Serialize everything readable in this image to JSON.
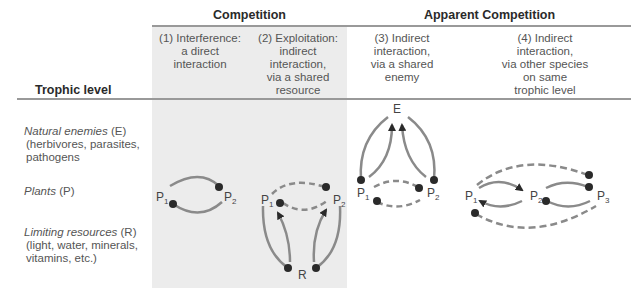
{
  "header": {
    "group_competition": "Competition",
    "group_apparent": "Apparent Competition",
    "row_header": "Trophic level"
  },
  "columns": [
    {
      "id": 1,
      "lines": [
        "(1) Interference:",
        "a direct",
        "interaction"
      ]
    },
    {
      "id": 2,
      "lines": [
        "(2) Exploitation:",
        "indirect",
        "interaction,",
        "via a shared",
        "resource"
      ]
    },
    {
      "id": 3,
      "lines": [
        "(3) Indirect",
        "interaction,",
        "via a shared",
        "enemy"
      ]
    },
    {
      "id": 4,
      "lines": [
        "(4) Indirect",
        "interaction,",
        "via other species",
        "on same",
        "trophic level"
      ]
    }
  ],
  "rows": [
    {
      "name": "Natural enemies",
      "abbr": "(E)",
      "detail": [
        "(herbivores, parasites,",
        "pathogens"
      ]
    },
    {
      "name": "Plants",
      "abbr": "(P)",
      "detail": []
    },
    {
      "name": "Limiting resources",
      "abbr": "(R)",
      "detail": [
        "(light, water, minerals,",
        "vitamins, etc.)"
      ]
    }
  ],
  "nodes": {
    "P": "P",
    "E": "E",
    "R": "R",
    "sub1": "1",
    "sub2": "2",
    "sub3": "3"
  },
  "colors": {
    "shade": "#ececec",
    "arc": "#8a8a8a",
    "dot": "#2a2a2a",
    "rule": "#999999"
  }
}
